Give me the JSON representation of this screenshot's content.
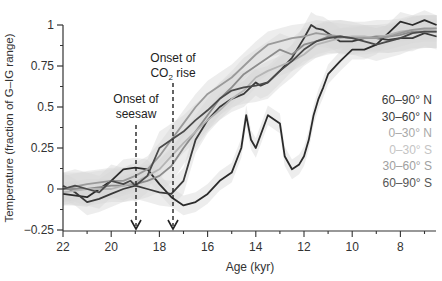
{
  "chart_data": {
    "type": "line",
    "title": "",
    "xlabel": "Age (kyr)",
    "ylabel": "Temperature (fraction of G–IG range)",
    "xlim": [
      22,
      6.5
    ],
    "ylim": [
      -0.25,
      1.05
    ],
    "x_reversed": true,
    "xticks": [
      22,
      20,
      18,
      16,
      14,
      12,
      10,
      8
    ],
    "yticks": [
      -0.25,
      0,
      0.25,
      0.5,
      0.75,
      1
    ],
    "ytick_labels": [
      "−0.25",
      "0",
      "0.25",
      "0.5",
      "0.75",
      "1"
    ],
    "grid": false,
    "legend_position": "right, inside plot",
    "annotations": [
      {
        "text": "Onset of seesaw",
        "x": 19.0,
        "arrow": "dashed, pointing down to x-axis"
      },
      {
        "text": "Onset of CO₂ rise",
        "x": 17.5,
        "arrow": "dashed, pointing down to x-axis"
      }
    ],
    "series": [
      {
        "name": "60–90° N",
        "color": "#2b2b2b",
        "x": [
          22,
          21,
          20.5,
          20,
          19.5,
          19,
          18.5,
          18,
          17.5,
          17,
          16.5,
          16,
          15.5,
          15,
          14.6,
          14.4,
          14.2,
          14,
          13.5,
          13,
          12.8,
          12.5,
          12.2,
          12,
          11.8,
          11.6,
          11.4,
          11.2,
          11,
          10.5,
          10,
          9.5,
          9,
          8.5,
          8,
          7.5,
          7,
          6.5
        ],
        "values": [
          -0.03,
          -0.05,
          0.0,
          0.05,
          0.12,
          0.13,
          0.12,
          0.03,
          -0.05,
          -0.1,
          -0.08,
          -0.03,
          0.05,
          0.1,
          0.25,
          0.45,
          0.3,
          0.25,
          0.45,
          0.4,
          0.2,
          0.12,
          0.15,
          0.2,
          0.3,
          0.45,
          0.55,
          0.62,
          0.7,
          0.78,
          0.85,
          0.85,
          0.88,
          0.95,
          1.02,
          1.0,
          1.03,
          1.0
        ]
      },
      {
        "name": "30–60° N",
        "color": "#3a3a3a",
        "x": [
          22,
          21.5,
          21,
          20.5,
          20,
          19.5,
          19,
          18.5,
          18,
          17.5,
          17,
          16.5,
          16,
          15.5,
          15,
          14.5,
          14,
          13.8,
          13.5,
          13,
          12.5,
          12,
          11.7,
          11.5,
          11.2,
          11,
          10.5,
          10,
          9.5,
          9,
          8.5,
          8,
          7.5,
          7,
          6.5
        ],
        "values": [
          0.02,
          -0.02,
          -0.08,
          -0.06,
          -0.03,
          0.0,
          0.02,
          0.0,
          -0.02,
          -0.03,
          0.05,
          0.3,
          0.42,
          0.5,
          0.55,
          0.58,
          0.65,
          0.63,
          0.65,
          0.72,
          0.8,
          0.92,
          1.0,
          0.98,
          0.97,
          0.95,
          0.9,
          0.9,
          0.92,
          0.92,
          0.91,
          0.92,
          0.92,
          0.95,
          0.93
        ]
      },
      {
        "name": "0–30° N",
        "color": "#8c8c8c",
        "x": [
          22,
          21,
          20,
          19.5,
          19,
          18.5,
          18,
          17.5,
          17,
          16.5,
          16,
          15.5,
          15,
          14.5,
          14,
          13.5,
          13,
          12.5,
          12,
          11.5,
          11,
          10.5,
          10,
          9.5,
          9,
          8.5,
          8,
          7.5,
          7,
          6.5
        ],
        "values": [
          0.0,
          0.0,
          0.02,
          0.02,
          0.03,
          0.05,
          0.08,
          0.14,
          0.25,
          0.35,
          0.45,
          0.55,
          0.62,
          0.7,
          0.75,
          0.8,
          0.85,
          0.82,
          0.88,
          0.9,
          0.93,
          0.93,
          0.92,
          0.92,
          0.93,
          0.93,
          0.94,
          0.96,
          0.96,
          0.96
        ]
      },
      {
        "name": "0–30° S",
        "color": "#b5b5b5",
        "x": [
          22,
          21,
          20,
          19.5,
          19,
          18.5,
          18,
          17.5,
          17,
          16.5,
          16,
          15.5,
          15,
          14.5,
          14,
          13.5,
          13,
          12.5,
          12,
          11.5,
          11,
          10.5,
          10,
          9.5,
          9,
          8.5,
          8,
          7.5,
          7,
          6.5
        ],
        "values": [
          -0.02,
          0.0,
          0.0,
          0.02,
          0.04,
          0.08,
          0.12,
          0.2,
          0.28,
          0.35,
          0.42,
          0.48,
          0.55,
          0.6,
          0.68,
          0.72,
          0.75,
          0.78,
          0.82,
          0.88,
          0.9,
          0.92,
          0.93,
          0.93,
          0.92,
          0.94,
          0.96,
          0.97,
          0.97,
          0.98
        ]
      },
      {
        "name": "30–60° S",
        "color": "#9a9a9a",
        "x": [
          22,
          21,
          20,
          19.5,
          19,
          18.5,
          18,
          17.5,
          17,
          16.5,
          16,
          15.5,
          15,
          14.5,
          14,
          13.5,
          13,
          12.5,
          12,
          11.5,
          11,
          10.5,
          10,
          9.5,
          9,
          8.5,
          8,
          7.5,
          7,
          6.5
        ],
        "values": [
          0.0,
          0.03,
          0.05,
          0.05,
          0.08,
          0.12,
          0.2,
          0.3,
          0.4,
          0.5,
          0.58,
          0.63,
          0.68,
          0.75,
          0.82,
          0.88,
          0.9,
          0.92,
          0.93,
          0.95,
          0.94,
          0.93,
          0.92,
          0.92,
          0.92,
          0.93,
          0.95,
          0.97,
          0.98,
          0.98
        ]
      },
      {
        "name": "60–90° S",
        "color": "#4a4a4a",
        "x": [
          22,
          21.5,
          21,
          20.5,
          20,
          19.5,
          19.2,
          19,
          18.5,
          18,
          17.5,
          17,
          16.5,
          16,
          15.5,
          15,
          14.5,
          14,
          13.5,
          13,
          12.5,
          12,
          11.5,
          11,
          10.5,
          10,
          9.5,
          9,
          8.5,
          8,
          7.5,
          7,
          6.5
        ],
        "values": [
          0.0,
          0.02,
          0.0,
          -0.02,
          0.05,
          0.03,
          0.05,
          0.02,
          0.08,
          0.25,
          0.3,
          0.35,
          0.42,
          0.48,
          0.55,
          0.6,
          0.62,
          0.63,
          0.65,
          0.72,
          0.78,
          0.85,
          0.9,
          0.92,
          0.93,
          0.92,
          0.9,
          0.88,
          0.9,
          0.92,
          0.95,
          0.96,
          0.96
        ]
      }
    ]
  },
  "axes": {
    "xlabel": "Age (kyr)",
    "ylabel": "Temperature (fraction of G–IG range)",
    "xtick_labels": [
      "22",
      "20",
      "18",
      "16",
      "14",
      "12",
      "10",
      "8"
    ],
    "ytick_labels": [
      "1",
      "0.75",
      "0.5",
      "0.25",
      "0",
      "−0.25"
    ]
  },
  "annotations": {
    "seesaw_line1": "Onset of",
    "seesaw_line2": "seesaw",
    "co2_line1": "Onset of",
    "co2_line2_prefix": "CO",
    "co2_line2_sub": "2",
    "co2_line2_suffix": " rise"
  },
  "legend": {
    "items": [
      {
        "label": "60–90° N",
        "color": "#3a3a3a"
      },
      {
        "label": "30–60° N",
        "color": "#3a3a3a"
      },
      {
        "label": "0–30° N",
        "color": "#a8a8a8"
      },
      {
        "label": "0–30° S",
        "color": "#c4c4c4"
      },
      {
        "label": "30–60° S",
        "color": "#a0a0a0"
      },
      {
        "label": "60–90° S",
        "color": "#555555"
      }
    ]
  }
}
